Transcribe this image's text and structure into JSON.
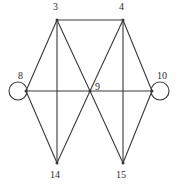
{
  "figure": {
    "background_color": "#ffffff",
    "stroke_color": "#3a3a3a",
    "label_color": "#2b2b2b"
  },
  "graph_data": {
    "type": "node-link-diagram",
    "directed": false,
    "vertex_count": 7,
    "edge_count": 15,
    "vertices": [
      {
        "id": "3",
        "label": "3",
        "x": 57,
        "y": 20,
        "label_x": 53,
        "label_y": 2,
        "self_loop": false
      },
      {
        "id": "4",
        "label": "4",
        "x": 123,
        "y": 20,
        "label_x": 119,
        "label_y": 2,
        "self_loop": false
      },
      {
        "id": "8",
        "label": "8",
        "x": 26,
        "y": 91,
        "label_x": 18,
        "label_y": 71,
        "self_loop": true,
        "loop_side": "left"
      },
      {
        "id": "9",
        "label": "9",
        "x": 90,
        "y": 91,
        "label_x": 95,
        "label_y": 82,
        "self_loop": false
      },
      {
        "id": "10",
        "label": "10",
        "x": 152,
        "y": 91,
        "label_x": 157,
        "label_y": 71,
        "self_loop": true,
        "loop_side": "right"
      },
      {
        "id": "14",
        "label": "14",
        "x": 57,
        "y": 163,
        "label_x": 50,
        "label_y": 170,
        "self_loop": false
      },
      {
        "id": "15",
        "label": "15",
        "x": 123,
        "y": 163,
        "label_x": 116,
        "label_y": 170,
        "self_loop": false
      }
    ],
    "edges": [
      {
        "source": "3",
        "target": "4"
      },
      {
        "source": "3",
        "target": "8"
      },
      {
        "source": "3",
        "target": "9"
      },
      {
        "source": "3",
        "target": "14"
      },
      {
        "source": "4",
        "target": "9"
      },
      {
        "source": "4",
        "target": "10"
      },
      {
        "source": "4",
        "target": "15"
      },
      {
        "source": "8",
        "target": "9"
      },
      {
        "source": "8",
        "target": "14"
      },
      {
        "source": "8",
        "target": "8"
      },
      {
        "source": "9",
        "target": "10"
      },
      {
        "source": "9",
        "target": "14"
      },
      {
        "source": "9",
        "target": "15"
      },
      {
        "source": "10",
        "target": "15"
      },
      {
        "source": "10",
        "target": "10"
      }
    ],
    "self_loops": [
      {
        "vertex": "8",
        "center_x": 18,
        "center_y": 91,
        "radius": 9
      },
      {
        "vertex": "10",
        "center_x": 160,
        "center_y": 91,
        "radius": 9
      }
    ]
  }
}
